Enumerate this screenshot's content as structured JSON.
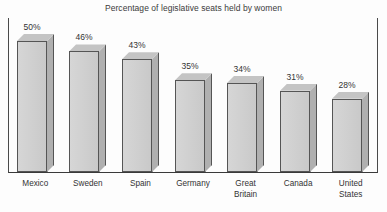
{
  "chart_data": {
    "type": "bar",
    "title": "Percentage of legislative seats held by women",
    "xlabel": "",
    "ylabel": "",
    "ylim": [
      0,
      55
    ],
    "grid": false,
    "legend": "none",
    "style": "3d-bars-grayscale",
    "categories": [
      "Mexico",
      "Sweden",
      "Spain",
      "Germany",
      "Great\nBritain",
      "Canada",
      "United\nStates"
    ],
    "values": [
      50,
      46,
      43,
      35,
      34,
      31,
      28
    ],
    "data_labels": [
      "50%",
      "46%",
      "43%",
      "35%",
      "34%",
      "31%",
      "28%"
    ]
  },
  "colors": {
    "bar_front": "#d0d0d0",
    "bar_side": "#b0b0b0",
    "bar_top": "#c4c4c4",
    "bar_outline": "#555555",
    "axis": "#3a3a3a",
    "text": "#333333",
    "background": "#fdfdfd"
  }
}
